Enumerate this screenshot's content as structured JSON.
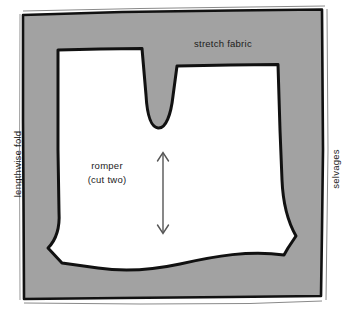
{
  "diagram": {
    "labels": {
      "stretch_fabric": "stretch fabric",
      "lengthwise_fold": "lengthwise fold",
      "selvages": "selvages",
      "piece_name": "romper",
      "piece_qty": "(cut two)"
    },
    "colors": {
      "fabric_fill": "#a2a2a2",
      "piece_fill": "#ffffff",
      "outline": "#111111",
      "page_background": "#ffffff",
      "text": "#1b1b1b",
      "grainline": "#555555"
    },
    "grainline": {
      "name": "grainline-arrow",
      "orientation": "vertical",
      "double_headed": true
    }
  }
}
